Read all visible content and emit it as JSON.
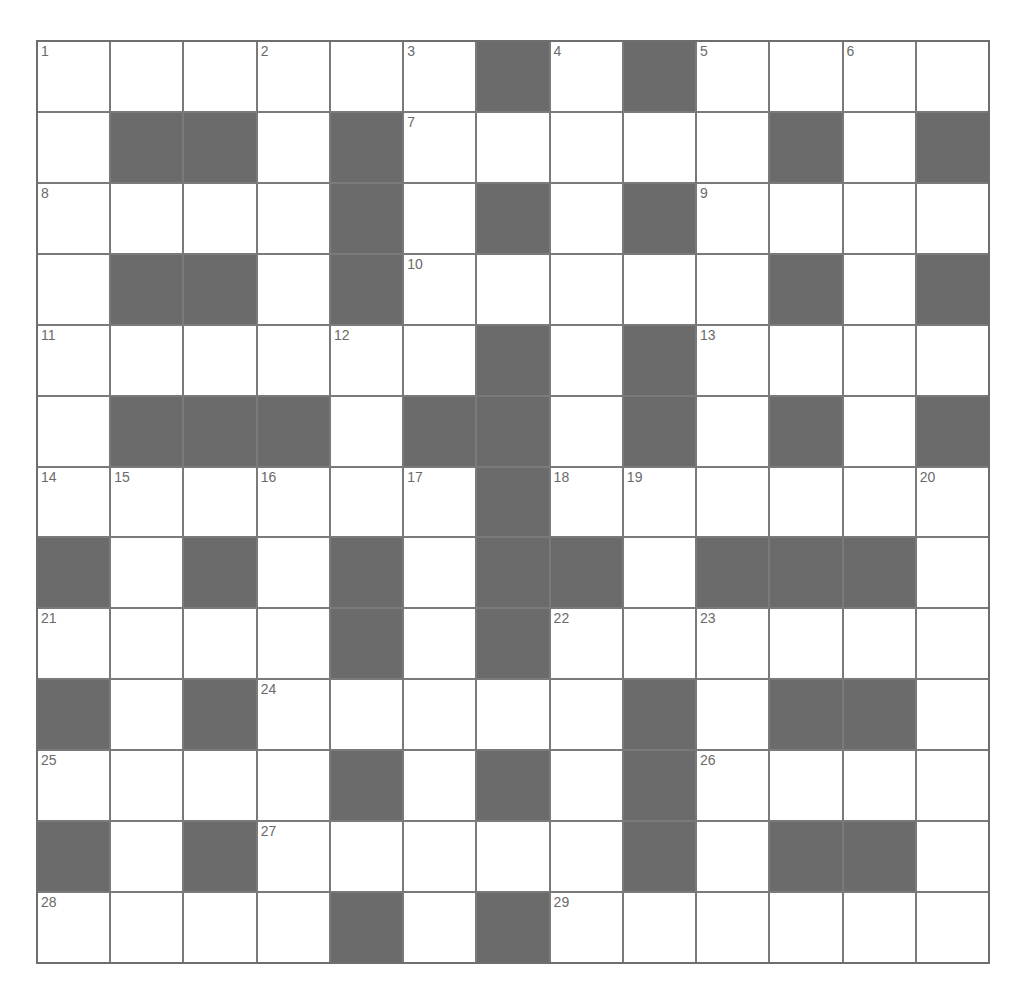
{
  "puzzle": {
    "rows": 13,
    "cols": 13,
    "colors": {
      "block": "#6b6b6b",
      "cell": "#ffffff",
      "line": "#7a7a7a",
      "number": "#6a6a6a"
    },
    "grid": [
      "......#.#....",
      ".##.#.....#.#",
      "....#.#.#....",
      ".##.#.....#.#",
      "......#.#....",
      ".###.##.#.#.#",
      "......#......",
      "#.#.#.##.###.",
      "....#.#......",
      "#.#.....#.##.",
      "....#.#.#....",
      "#.#.....#.##.",
      "....#.#......"
    ],
    "numbers": [
      {
        "r": 0,
        "c": 0,
        "n": "1"
      },
      {
        "r": 0,
        "c": 3,
        "n": "2"
      },
      {
        "r": 0,
        "c": 5,
        "n": "3"
      },
      {
        "r": 0,
        "c": 7,
        "n": "4"
      },
      {
        "r": 0,
        "c": 9,
        "n": "5"
      },
      {
        "r": 0,
        "c": 11,
        "n": "6"
      },
      {
        "r": 1,
        "c": 5,
        "n": "7"
      },
      {
        "r": 2,
        "c": 0,
        "n": "8"
      },
      {
        "r": 2,
        "c": 9,
        "n": "9"
      },
      {
        "r": 3,
        "c": 5,
        "n": "10"
      },
      {
        "r": 4,
        "c": 0,
        "n": "11"
      },
      {
        "r": 4,
        "c": 4,
        "n": "12"
      },
      {
        "r": 4,
        "c": 9,
        "n": "13"
      },
      {
        "r": 6,
        "c": 0,
        "n": "14"
      },
      {
        "r": 6,
        "c": 1,
        "n": "15"
      },
      {
        "r": 6,
        "c": 3,
        "n": "16"
      },
      {
        "r": 6,
        "c": 5,
        "n": "17"
      },
      {
        "r": 6,
        "c": 7,
        "n": "18"
      },
      {
        "r": 6,
        "c": 8,
        "n": "19"
      },
      {
        "r": 6,
        "c": 12,
        "n": "20"
      },
      {
        "r": 8,
        "c": 0,
        "n": "21"
      },
      {
        "r": 8,
        "c": 7,
        "n": "22"
      },
      {
        "r": 8,
        "c": 9,
        "n": "23"
      },
      {
        "r": 9,
        "c": 3,
        "n": "24"
      },
      {
        "r": 10,
        "c": 0,
        "n": "25"
      },
      {
        "r": 10,
        "c": 9,
        "n": "26"
      },
      {
        "r": 11,
        "c": 3,
        "n": "27"
      },
      {
        "r": 12,
        "c": 0,
        "n": "28"
      },
      {
        "r": 12,
        "c": 7,
        "n": "29"
      }
    ]
  }
}
